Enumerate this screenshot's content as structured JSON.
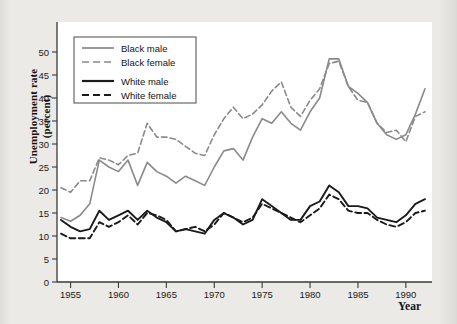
{
  "figure": {
    "ylabel_line1": "Unemployment rate",
    "ylabel_line2": "(percent)",
    "xlabel": "Year",
    "background_color": "#e9e8e4",
    "plot_background_color": "#ffffff"
  },
  "chart_data": {
    "type": "line",
    "title": "",
    "xlabel": "Year",
    "ylabel": "Unemployment rate (percent)",
    "xlim": [
      1954,
      1992
    ],
    "ylim": [
      0,
      52
    ],
    "xticks": [
      1955,
      1960,
      1965,
      1970,
      1975,
      1980,
      1985,
      1990
    ],
    "yticks": [
      0,
      5,
      10,
      15,
      20,
      25,
      30,
      35,
      40,
      45,
      50
    ],
    "grid": false,
    "legend_position": "upper left",
    "x": [
      1954,
      1955,
      1956,
      1957,
      1958,
      1959,
      1960,
      1961,
      1962,
      1963,
      1964,
      1965,
      1966,
      1967,
      1968,
      1969,
      1970,
      1971,
      1972,
      1973,
      1974,
      1975,
      1976,
      1977,
      1978,
      1979,
      1980,
      1981,
      1982,
      1983,
      1984,
      1985,
      1986,
      1987,
      1988,
      1989,
      1990,
      1991,
      1992
    ],
    "series": [
      {
        "name": "Black male",
        "color": "#8a8a8a",
        "style": "solid",
        "values": [
          14.0,
          13.2,
          14.5,
          17.0,
          26.5,
          25.0,
          24.0,
          26.5,
          21.0,
          26.0,
          24.0,
          23.0,
          21.5,
          23.0,
          22.0,
          21.0,
          25.0,
          28.5,
          29.0,
          26.5,
          31.5,
          35.5,
          34.5,
          37.0,
          34.5,
          33.0,
          37.0,
          40.0,
          48.5,
          48.5,
          42.5,
          41.0,
          39.0,
          34.5,
          32.0,
          31.0,
          32.0,
          36.5,
          42.0
        ]
      },
      {
        "name": "Black female",
        "color": "#8a8a8a",
        "style": "dashed",
        "values": [
          20.5,
          19.5,
          22.0,
          22.0,
          27.0,
          26.5,
          25.5,
          27.5,
          28.0,
          34.5,
          31.5,
          31.5,
          31.0,
          29.5,
          28.0,
          27.5,
          32.0,
          35.5,
          38.0,
          35.5,
          36.5,
          38.5,
          41.5,
          43.5,
          38.0,
          36.0,
          39.5,
          42.0,
          47.5,
          48.0,
          42.5,
          39.5,
          39.0,
          34.5,
          32.5,
          33.0,
          30.5,
          36.0,
          37.0
        ]
      },
      {
        "name": "White male",
        "color": "#1a1a1a",
        "style": "solid",
        "values": [
          13.5,
          12.0,
          11.0,
          11.5,
          15.5,
          13.5,
          14.5,
          15.5,
          13.5,
          15.5,
          14.0,
          13.0,
          11.0,
          11.5,
          11.0,
          10.5,
          13.5,
          15.0,
          14.0,
          12.5,
          13.5,
          18.0,
          16.5,
          15.0,
          13.5,
          13.5,
          16.5,
          17.5,
          21.0,
          19.5,
          16.5,
          16.5,
          16.0,
          14.0,
          13.5,
          13.0,
          14.5,
          17.0,
          18.0
        ]
      },
      {
        "name": "White female",
        "color": "#1a1a1a",
        "style": "dashed",
        "values": [
          10.5,
          9.5,
          9.5,
          9.5,
          13.0,
          12.0,
          13.0,
          14.5,
          12.5,
          15.0,
          14.5,
          13.5,
          11.0,
          11.5,
          12.0,
          11.0,
          12.5,
          15.0,
          14.0,
          13.0,
          14.0,
          17.0,
          16.0,
          15.0,
          14.0,
          13.0,
          14.5,
          16.0,
          19.0,
          18.0,
          15.5,
          15.0,
          15.0,
          13.5,
          12.5,
          12.0,
          13.0,
          15.0,
          15.5
        ]
      }
    ]
  },
  "legend": {
    "items": [
      {
        "label": "Black male",
        "color": "#8a8a8a",
        "style": "solid"
      },
      {
        "label": "Black female",
        "color": "#8a8a8a",
        "style": "dashed"
      },
      {
        "label": "White male",
        "color": "#1a1a1a",
        "style": "solid"
      },
      {
        "label": "White female",
        "color": "#1a1a1a",
        "style": "dashed"
      }
    ]
  }
}
